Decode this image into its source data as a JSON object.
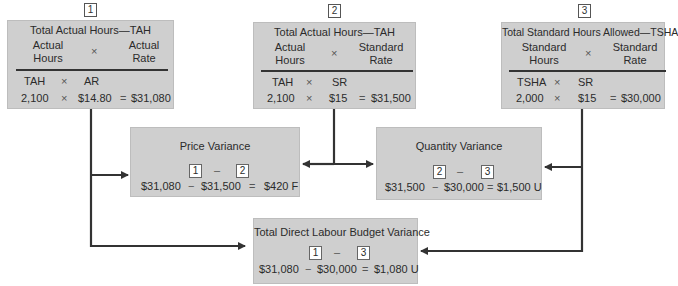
{
  "inputs": [
    {
      "id": "1",
      "title": "Total Actual Hours—TAH",
      "col_left": [
        "Actual",
        "Hours"
      ],
      "times": "×",
      "col_right": [
        "Actual",
        "Rate"
      ],
      "symbol_left": "TAH",
      "symbol_right": "AR",
      "value_left": "2,100",
      "value_right": "$14.80",
      "equals": "=",
      "result": "$31,080"
    },
    {
      "id": "2",
      "title": "Total Actual Hours—TAH",
      "col_left": [
        "Actual",
        "Hours"
      ],
      "times": "×",
      "col_right": [
        "Standard",
        "Rate"
      ],
      "symbol_left": "TAH",
      "symbol_right": "SR",
      "value_left": "2,100",
      "value_right": "$15",
      "equals": "=",
      "result": "$31,500"
    },
    {
      "id": "3",
      "title": "Total Standard Hours Allowed—TSHA",
      "col_left": [
        "Standard",
        "Hours"
      ],
      "times": "×",
      "col_right": [
        "Standard",
        "Rate"
      ],
      "symbol_left": "TSHA",
      "symbol_right": "SR",
      "value_left": "2,000",
      "value_right": "$15",
      "equals": "=",
      "result": "$30,000"
    }
  ],
  "variances": {
    "price": {
      "title": "Price Variance",
      "ref_a": "1",
      "minus": "–",
      "ref_b": "2",
      "val_a": "$31,080",
      "op": "−",
      "val_b": "$31,500",
      "equals": "=",
      "result": "$420 F"
    },
    "quantity": {
      "title": "Quantity Variance",
      "ref_a": "2",
      "minus": "–",
      "ref_b": "3",
      "val_a": "$31,500",
      "op": "−",
      "val_b": "$30,000",
      "equals": "=",
      "result": "$1,500 U"
    },
    "budget": {
      "title": "Total Direct Labour Budget Variance",
      "ref_a": "1",
      "minus": "–",
      "ref_b": "3",
      "val_a": "$31,080",
      "op": "−",
      "val_b": "$30,000",
      "equals": "=",
      "result": "$1,080 U"
    }
  },
  "colors": {
    "box_fill": "#cfcfcf",
    "arrow": "#333333",
    "text": "#2b2b2b"
  }
}
